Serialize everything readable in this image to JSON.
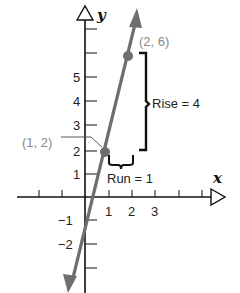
{
  "diagram": {
    "axes": {
      "x_label": "x",
      "y_label": "y",
      "x_ticks": [
        "1",
        "2",
        "3"
      ],
      "y_ticks_positive": [
        "1",
        "2",
        "3",
        "4",
        "5"
      ],
      "y_ticks_negative": [
        "−1",
        "−2"
      ]
    },
    "points": [
      {
        "label": "(1, 2)",
        "x": 1,
        "y": 2
      },
      {
        "label": "(2, 6)",
        "x": 2,
        "y": 6
      }
    ],
    "annotations": {
      "rise": "Rise  =  4",
      "run": "Run  =  1"
    },
    "colors": {
      "line": "#6e6e6e",
      "point": "#6e6e6e",
      "axis": "#111111",
      "bracket": "#111111",
      "point_label": "#8a8a8a"
    }
  }
}
